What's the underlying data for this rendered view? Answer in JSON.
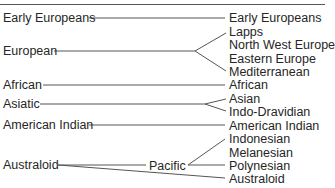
{
  "diagram": {
    "left": [
      {
        "label": "Early Europeans",
        "x": 3,
        "y": 11
      },
      {
        "label": "European",
        "x": 3,
        "y": 44
      },
      {
        "label": "African",
        "x": 3,
        "y": 78
      },
      {
        "label": "Asiatic",
        "x": 3,
        "y": 97
      },
      {
        "label": "American Indian",
        "x": 3,
        "y": 118
      },
      {
        "label": "Australoid",
        "x": 3,
        "y": 158
      }
    ],
    "middle": [
      {
        "label": "Pacific",
        "x": 149,
        "y": 159
      }
    ],
    "right": [
      {
        "label": "Early Europeans",
        "y": 11
      },
      {
        "label": "Lapps",
        "y": 25
      },
      {
        "label": "North West Europe",
        "y": 38
      },
      {
        "label": "Eastern Europe",
        "y": 52
      },
      {
        "label": "Mediterranean",
        "y": 65
      },
      {
        "label": "African",
        "y": 78
      },
      {
        "label": "Asian",
        "y": 92
      },
      {
        "label": "Indo-Dravidian",
        "y": 105
      },
      {
        "label": "American Indian",
        "y": 119
      },
      {
        "label": "Indonesian",
        "y": 132
      },
      {
        "label": "Melanesian",
        "y": 146
      },
      {
        "label": "Polynesian",
        "y": 159
      },
      {
        "label": "Australoid",
        "y": 172
      }
    ],
    "line_color": "#555555"
  }
}
